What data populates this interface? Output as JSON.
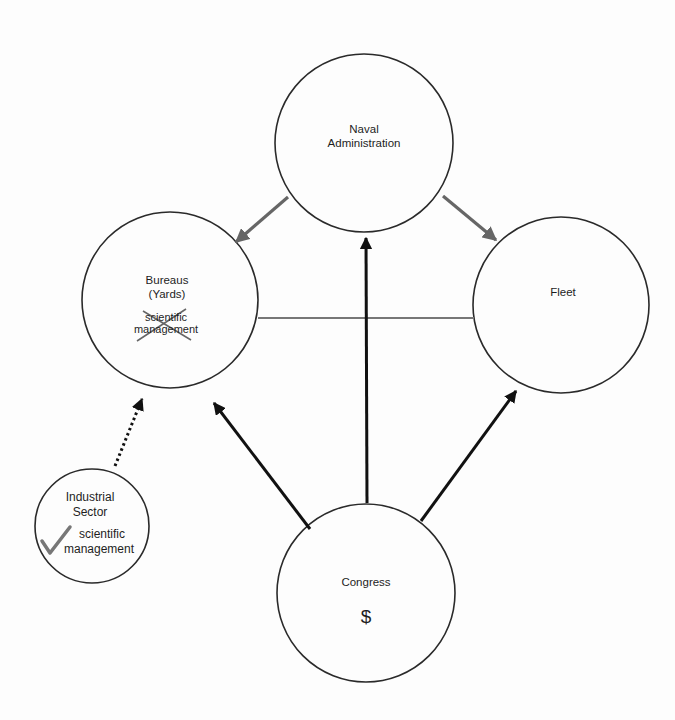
{
  "diagram": {
    "nodes": {
      "naval_admin": {
        "line1": "Naval",
        "line2": "Administration"
      },
      "bureaus": {
        "line1": "Bureaus",
        "line2": "(Yards)",
        "note1": "scientific",
        "note2": "management",
        "note_status": "crossed-out"
      },
      "fleet": {
        "line1": "Fleet"
      },
      "industrial": {
        "line1": "Industrial",
        "line2": "Sector",
        "note1": "scientific",
        "note2": "management",
        "note_status": "checked"
      },
      "congress": {
        "line1": "Congress",
        "symbol": "$"
      }
    },
    "edges": [
      {
        "from": "Naval Administration",
        "to": "Bureaus (Yards)",
        "style": "gray-arrow"
      },
      {
        "from": "Naval Administration",
        "to": "Fleet",
        "style": "gray-arrow"
      },
      {
        "from": "Bureaus (Yards)",
        "to": "Fleet",
        "style": "gray-line"
      },
      {
        "from": "Congress",
        "to": "Naval Administration",
        "style": "black-arrow"
      },
      {
        "from": "Congress",
        "to": "Bureaus (Yards)",
        "style": "black-arrow"
      },
      {
        "from": "Congress",
        "to": "Fleet",
        "style": "black-arrow"
      },
      {
        "from": "Industrial Sector",
        "to": "Bureaus (Yards)",
        "style": "dotted-arrow"
      }
    ],
    "colors": {
      "outline": "#2a2a2a",
      "gray_arrow": "#6e6e6e",
      "black_arrow": "#111111",
      "check": "#777777"
    }
  }
}
